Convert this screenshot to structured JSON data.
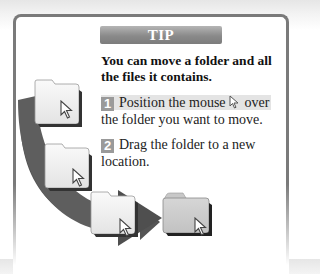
{
  "tip": {
    "banner": "TIP",
    "headline": "You can move a folder and all the files it contains.",
    "steps": [
      {
        "number": "1",
        "text_before": "Position the mouse",
        "text_after": "over",
        "text_line2": "the folder you want to move."
      },
      {
        "number": "2",
        "text": "Drag the folder to a new location."
      }
    ]
  },
  "illustration": {
    "description": "Curved dark gray arrow showing a folder being dragged from the top-left down to a new location on the right",
    "arrow_color": "#5a5a5a",
    "source_folder_color": "#f0f0f0",
    "destination_folder_color": "#cfcfcf"
  }
}
